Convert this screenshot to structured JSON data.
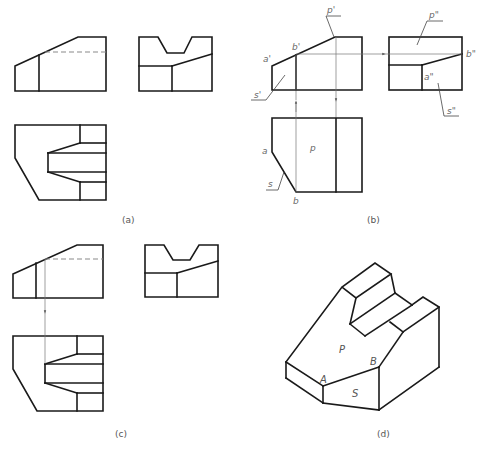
{
  "figure": {
    "width": 490,
    "height": 449,
    "colors": {
      "line": "#1a1a1a",
      "projection": "#777777",
      "hidden": "#8a8a8a",
      "label": "#6a6a6a"
    },
    "captions": [
      {
        "id": "a",
        "text": "(a)",
        "x": 122,
        "y": 223
      },
      {
        "id": "b",
        "text": "(b)",
        "x": 367,
        "y": 223
      },
      {
        "id": "c",
        "text": "(c)",
        "x": 115,
        "y": 437
      },
      {
        "id": "d",
        "text": "(d)",
        "x": 377,
        "y": 437
      }
    ],
    "panels": {
      "a": {
        "name": "three-view drawing"
      },
      "b": {
        "name": "projection analysis of faces P and S",
        "labels": [
          {
            "text": "p'",
            "x": 327,
            "y": 13
          },
          {
            "text": "b'",
            "x": 292,
            "y": 50
          },
          {
            "text": "a'",
            "x": 263,
            "y": 62
          },
          {
            "text": "s'",
            "x": 254,
            "y": 99
          },
          {
            "text": "p\"",
            "x": 429,
            "y": 18
          },
          {
            "text": "b\"",
            "x": 467,
            "y": 57
          },
          {
            "text": "a\"",
            "x": 424,
            "y": 80
          },
          {
            "text": "s\"",
            "x": 447,
            "y": 114
          },
          {
            "text": "p",
            "x": 310,
            "y": 151
          },
          {
            "text": "a",
            "x": 262,
            "y": 154
          },
          {
            "text": "s",
            "x": 268,
            "y": 186
          },
          {
            "text": "b",
            "x": 293,
            "y": 204
          }
        ]
      },
      "c": {
        "name": "projection of hidden edge to top view"
      },
      "d": {
        "name": "isometric view",
        "labels": [
          {
            "text": "P",
            "x": 339,
            "y": 353
          },
          {
            "text": "B",
            "x": 370,
            "y": 365
          },
          {
            "text": "A",
            "x": 320,
            "y": 383
          },
          {
            "text": "S",
            "x": 352,
            "y": 396
          }
        ]
      }
    }
  }
}
